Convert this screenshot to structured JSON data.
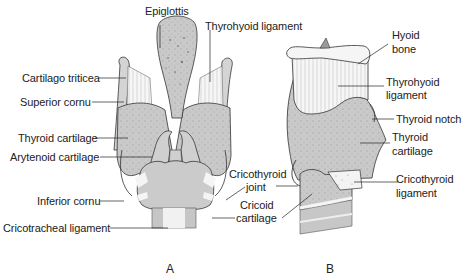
{
  "figure_a": {
    "letter": "A",
    "labels": {
      "epiglottis": "Epiglottis",
      "thyrohyoid_ligament": "Thyrohyoid ligament",
      "cartilago_triticea": "Cartilago triticea",
      "superior_cornu": "Superior cornu",
      "thyroid_cartilage": "Thyroid cartilage",
      "arytenoid_cartilage": "Arytenoid cartilage",
      "inferior_cornu": "Inferior cornu",
      "cricotracheal_ligament": "Cricotracheal ligament"
    }
  },
  "figure_b": {
    "letter": "B",
    "labels": {
      "hyoid_bone_1": "Hyoid",
      "hyoid_bone_2": "bone",
      "thyrohyoid_ligament_1": "Thyrohyoid",
      "thyrohyoid_ligament_2": "ligament",
      "thyroid_notch": "Thyroid notch",
      "thyroid_cartilage_1": "Thyroid",
      "thyroid_cartilage_2": "cartilage",
      "cricothyroid_ligament_1": "Cricothyroid",
      "cricothyroid_ligament_2": "ligament",
      "cricothyroid_joint_1": "Cricothyroid",
      "cricothyroid_joint_2": "joint",
      "cricoid_cartilage_1": "Cricoid",
      "cricoid_cartilage_2": "cartilage"
    }
  },
  "colors": {
    "cartilage_fill": "#c8c8c8",
    "ligament_fill": "#f4f4f4",
    "outline": "#333333"
  }
}
